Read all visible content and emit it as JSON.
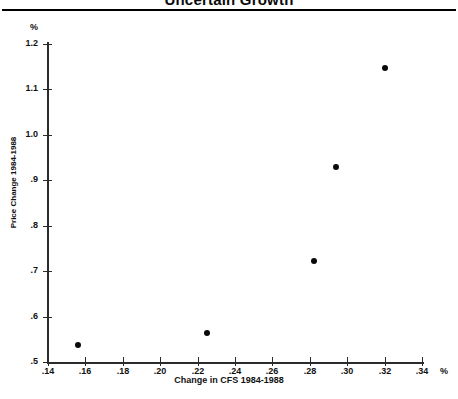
{
  "chart_data": {
    "type": "scatter",
    "title": "Uncertain Growth",
    "xlabel": "Change in CFS 1984-1988",
    "ylabel": "Price Change 1984-1988",
    "x_unit": "%",
    "y_unit": "%",
    "xlim": [
      0.14,
      0.34
    ],
    "ylim": [
      0.5,
      1.2
    ],
    "grid": false,
    "legend": null,
    "x_ticks": [
      ".14",
      ".16",
      ".18",
      ".20",
      ".22",
      ".24",
      ".26",
      ".28",
      ".30",
      ".32",
      ".34"
    ],
    "x_tick_values": [
      0.14,
      0.16,
      0.18,
      0.2,
      0.22,
      0.24,
      0.26,
      0.28,
      0.3,
      0.32,
      0.34
    ],
    "y_ticks": [
      ".5",
      ".6",
      ".7",
      ".8",
      ".9",
      "1.0",
      "1.1",
      "1.2"
    ],
    "y_tick_values": [
      0.5,
      0.6,
      0.7,
      0.8,
      0.9,
      1.0,
      1.1,
      1.2
    ],
    "x": [
      0.156,
      0.225,
      0.282,
      0.294,
      0.32
    ],
    "y": [
      0.538,
      0.564,
      0.723,
      0.93,
      1.148
    ],
    "points": [
      {
        "x": 0.156,
        "y": 0.538
      },
      {
        "x": 0.225,
        "y": 0.564
      },
      {
        "x": 0.282,
        "y": 0.723
      },
      {
        "x": 0.294,
        "y": 0.93
      },
      {
        "x": 0.32,
        "y": 1.148
      }
    ],
    "marker_color": "#0a0a0a"
  }
}
